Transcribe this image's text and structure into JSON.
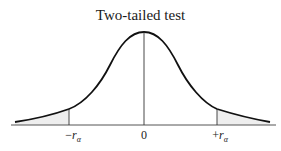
{
  "figure": {
    "title": "Two-tailed test",
    "distribution": "normal",
    "shaded_regions": [
      "left tail",
      "right tail"
    ],
    "colors": {
      "curve": "#111111",
      "shade": "#eeeeee",
      "axis": "#555555"
    },
    "ticks": [
      {
        "id": "neg",
        "sign": "−",
        "symbol": "r",
        "subscript": "α",
        "x": 69
      },
      {
        "id": "zero",
        "text": "0",
        "x": 144
      },
      {
        "id": "pos",
        "sign": "+",
        "symbol": "r",
        "subscript": "α",
        "x": 217
      }
    ]
  }
}
